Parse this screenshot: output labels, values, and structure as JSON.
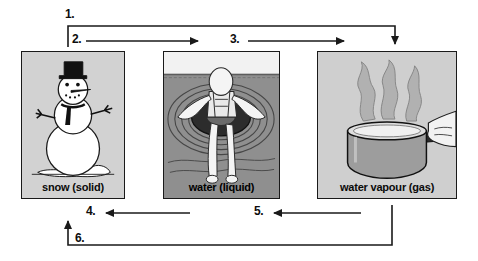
{
  "diagram": {
    "steps": [
      {
        "id": "step-1",
        "label": "1."
      },
      {
        "id": "step-2",
        "label": "2."
      },
      {
        "id": "step-3",
        "label": "3."
      },
      {
        "id": "step-4",
        "label": "4."
      },
      {
        "id": "step-5",
        "label": "5."
      },
      {
        "id": "step-6",
        "label": "6."
      }
    ],
    "panels": [
      {
        "id": "panel-snow",
        "caption": "snow (solid)",
        "icon": "snowman-icon",
        "state": "solid",
        "background": "#d2d2d2"
      },
      {
        "id": "panel-water",
        "caption": "water (liquid)",
        "icon": "person-floating-in-inner-tube-icon",
        "state": "liquid",
        "background": "#9b9b9b"
      },
      {
        "id": "panel-vapour",
        "caption": "water vapour (gas)",
        "icon": "steaming-pot-icon",
        "state": "gas",
        "background": "#cfcfcf"
      }
    ],
    "arrows": [
      {
        "id": "arrow-1",
        "from": "snow (solid)",
        "to": "water vapour (gas)",
        "direction": "right-then-down",
        "step": "1."
      },
      {
        "id": "arrow-2",
        "from": "snow (solid)",
        "to": "water (liquid)",
        "direction": "right",
        "step": "2."
      },
      {
        "id": "arrow-3",
        "from": "water (liquid)",
        "to": "water vapour (gas)",
        "direction": "right",
        "step": "3."
      },
      {
        "id": "arrow-4",
        "from": "water (liquid)",
        "to": "snow (solid)",
        "direction": "left",
        "step": "4."
      },
      {
        "id": "arrow-5",
        "from": "water vapour (gas)",
        "to": "water (liquid)",
        "direction": "left",
        "step": "5."
      },
      {
        "id": "arrow-6",
        "from": "water vapour (gas)",
        "to": "snow (solid)",
        "direction": "left-then-up",
        "step": "6."
      }
    ],
    "colors": {
      "stroke": "#1a1a1a",
      "page_background": "#ffffff"
    }
  }
}
